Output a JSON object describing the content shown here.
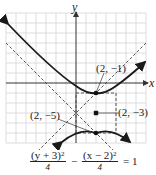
{
  "figure": {
    "axes": {
      "x_label": "x",
      "y_label": "y"
    },
    "grid": {
      "unit_px": 10,
      "x_range": [
        -7,
        7
      ],
      "y_range": [
        -6,
        7
      ],
      "color": "#d4d4d4"
    },
    "colors": {
      "curve": "#1a1a1a",
      "dashed": "#444444",
      "axis": "#333333",
      "point": "#111111"
    },
    "hyperbola": {
      "center": [
        2,
        -3
      ],
      "a": 2,
      "b": 2,
      "orientation": "vertical"
    },
    "points": [
      {
        "label": "(2, −1)",
        "coords": [
          2,
          -1
        ],
        "role": "vertex"
      },
      {
        "label": "(2, −3)",
        "coords": [
          2,
          -3
        ],
        "role": "center"
      },
      {
        "label": "(2, −5)",
        "coords": [
          2,
          -5
        ],
        "role": "vertex"
      }
    ]
  },
  "equation": {
    "term1_num": "(y + 3)",
    "term1_exp": "2",
    "term1_den": "4",
    "minus": "−",
    "term2_num": "(x − 2)",
    "term2_exp": "2",
    "term2_den": "4",
    "equals": "= 1"
  }
}
